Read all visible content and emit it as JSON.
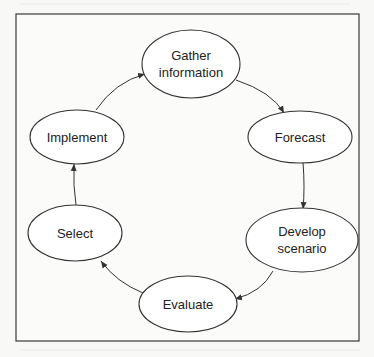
{
  "diagram": {
    "type": "cycle",
    "title": "",
    "nodes": [
      {
        "id": "gather",
        "lines": [
          "Gather",
          "information"
        ]
      },
      {
        "id": "forecast",
        "lines": [
          "Forecast"
        ]
      },
      {
        "id": "develop",
        "lines": [
          "Develop",
          "scenario"
        ]
      },
      {
        "id": "evaluate",
        "lines": [
          "Evaluate"
        ]
      },
      {
        "id": "select",
        "lines": [
          "Select"
        ]
      },
      {
        "id": "implement",
        "lines": [
          "Implement"
        ]
      }
    ],
    "edges": [
      {
        "from": "gather",
        "to": "forecast"
      },
      {
        "from": "forecast",
        "to": "develop"
      },
      {
        "from": "develop",
        "to": "evaluate"
      },
      {
        "from": "evaluate",
        "to": "select"
      },
      {
        "from": "select",
        "to": "implement"
      },
      {
        "from": "implement",
        "to": "gather"
      }
    ]
  }
}
